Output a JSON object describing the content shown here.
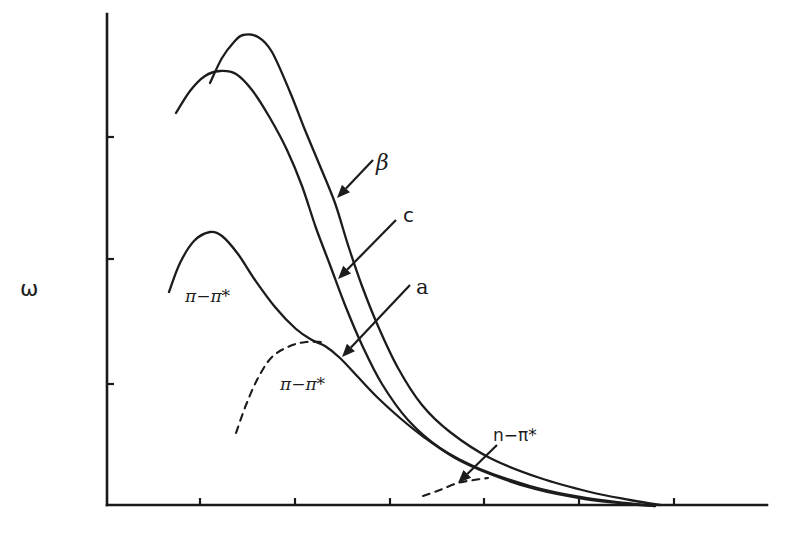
{
  "chart_data": {
    "type": "line",
    "title": "",
    "xlabel": "",
    "ylabel": "ω",
    "grid": false,
    "legend": "none (direct labels with arrows)",
    "x_ticks_px": [
      200,
      295,
      390,
      484,
      579,
      674
    ],
    "y_ticks_px": [
      137,
      259,
      384
    ],
    "tick_labels": {
      "x": [],
      "y": []
    },
    "axis_px": {
      "origin": [
        107,
        505
      ],
      "x_end": 767,
      "y_top": 14
    },
    "series": [
      {
        "name": "β",
        "style": "solid",
        "points_px": [
          [
            210,
            83
          ],
          [
            222,
            58
          ],
          [
            234,
            42
          ],
          [
            243,
            35
          ],
          [
            258,
            37
          ],
          [
            272,
            52
          ],
          [
            290,
            92
          ],
          [
            305,
            130
          ],
          [
            320,
            166
          ],
          [
            335,
            203
          ],
          [
            348,
            245
          ],
          [
            362,
            286
          ],
          [
            378,
            326
          ],
          [
            398,
            368
          ],
          [
            422,
            405
          ],
          [
            450,
            432
          ],
          [
            490,
            458
          ],
          [
            540,
            478
          ],
          [
            590,
            492
          ],
          [
            630,
            500
          ],
          [
            660,
            505
          ]
        ]
      },
      {
        "name": "c",
        "style": "solid",
        "points_px": [
          [
            176,
            113
          ],
          [
            190,
            91
          ],
          [
            205,
            76
          ],
          [
            220,
            71
          ],
          [
            236,
            74
          ],
          [
            252,
            90
          ],
          [
            270,
            118
          ],
          [
            287,
            150
          ],
          [
            302,
            186
          ],
          [
            316,
            228
          ],
          [
            330,
            265
          ],
          [
            345,
            305
          ],
          [
            362,
            345
          ],
          [
            382,
            384
          ],
          [
            408,
            420
          ],
          [
            440,
            448
          ],
          [
            480,
            469
          ],
          [
            530,
            486
          ],
          [
            580,
            497
          ],
          [
            625,
            503
          ],
          [
            655,
            506
          ]
        ]
      },
      {
        "name": "a",
        "style": "solid",
        "points_px": [
          [
            169,
            292
          ],
          [
            180,
            263
          ],
          [
            194,
            241
          ],
          [
            210,
            232
          ],
          [
            222,
            236
          ],
          [
            238,
            254
          ],
          [
            255,
            280
          ],
          [
            275,
            307
          ],
          [
            296,
            329
          ],
          [
            312,
            340
          ],
          [
            325,
            346
          ],
          [
            340,
            358
          ],
          [
            358,
            377
          ],
          [
            378,
            398
          ],
          [
            400,
            418
          ],
          [
            425,
            438
          ],
          [
            455,
            458
          ],
          [
            490,
            474
          ],
          [
            535,
            489
          ],
          [
            585,
            499
          ],
          [
            630,
            504
          ],
          [
            655,
            506
          ]
        ]
      },
      {
        "name": "π−π* (component)",
        "style": "dashed",
        "points_px": [
          [
            236,
            433
          ],
          [
            246,
            405
          ],
          [
            258,
            378
          ],
          [
            272,
            357
          ],
          [
            290,
            346
          ],
          [
            306,
            342
          ],
          [
            322,
            342
          ]
        ]
      },
      {
        "name": "n−π* (component)",
        "style": "dashed",
        "points_px": [
          [
            423,
            496
          ],
          [
            440,
            490
          ],
          [
            458,
            483
          ],
          [
            474,
            480
          ],
          [
            488,
            478
          ]
        ]
      }
    ],
    "annotations": [
      {
        "text": "β",
        "pos_px": [
          378,
          170
        ],
        "arrow_from_px": [
          373,
          160
        ],
        "arrow_to_px": [
          337,
          198
        ]
      },
      {
        "text": "c",
        "pos_px": [
          404,
          223
        ],
        "arrow_from_px": [
          396,
          220
        ],
        "arrow_to_px": [
          338,
          279
        ]
      },
      {
        "text": "a",
        "pos_px": [
          418,
          294
        ],
        "arrow_from_px": [
          410,
          285
        ],
        "arrow_to_px": [
          342,
          357
        ]
      },
      {
        "text": "π−π*",
        "pos_px": [
          186,
          301
        ]
      },
      {
        "text": "π−π*",
        "pos_px": [
          281,
          391
        ]
      },
      {
        "text": "n−π*",
        "pos_px": [
          505,
          440
        ],
        "arrow_from_px": [
          497,
          445
        ],
        "arrow_to_px": [
          458,
          483
        ]
      }
    ]
  },
  "labels": {
    "y_axis": "ω",
    "beta": "β",
    "c": "c",
    "a": "a",
    "pi_pi_star_upper": "π−π*",
    "pi_pi_star_lower": "π−π*",
    "n_pi_star": "n−π*"
  }
}
